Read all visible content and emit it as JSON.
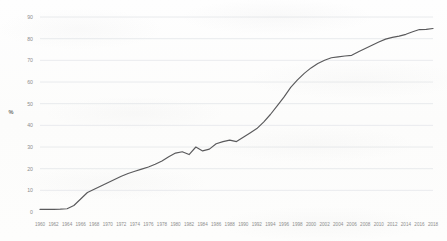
{
  "chart_data": {
    "type": "line",
    "title": "",
    "xlabel": "",
    "ylabel": "%",
    "ylim": [
      0,
      90
    ],
    "ytick_values": [
      0,
      10,
      20,
      30,
      40,
      50,
      60,
      70,
      80,
      90
    ],
    "ytick_labels": [
      "0",
      "10",
      "20",
      "30",
      "40",
      "50",
      "60",
      "70",
      "80",
      "90"
    ],
    "grid": true,
    "legend": "none",
    "xlim": [
      1960,
      2018
    ],
    "xtick_labels": [
      "1960",
      "1962",
      "1964",
      "1966",
      "1968",
      "1970",
      "1972",
      "1974",
      "1976",
      "1978",
      "1980",
      "1982",
      "1984",
      "1986",
      "1988",
      "1990",
      "1992",
      "1994",
      "1996",
      "1998",
      "2000",
      "2002",
      "2004",
      "2006",
      "2008",
      "2010",
      "2012",
      "2014",
      "2016",
      "2018"
    ],
    "line_color": "#5a5a5c",
    "series": [
      {
        "name": "%",
        "x": [
          1960,
          1961,
          1962,
          1963,
          1964,
          1965,
          1966,
          1967,
          1968,
          1969,
          1970,
          1971,
          1972,
          1973,
          1974,
          1975,
          1976,
          1977,
          1978,
          1979,
          1980,
          1981,
          1982,
          1983,
          1984,
          1985,
          1986,
          1987,
          1988,
          1989,
          1990,
          1991,
          1992,
          1993,
          1994,
          1995,
          1996,
          1997,
          1998,
          1999,
          2000,
          2001,
          2002,
          2003,
          2004,
          2005,
          2006,
          2007,
          2008,
          2009,
          2010,
          2011,
          2012,
          2013,
          2014,
          2015,
          2016,
          2017,
          2018
        ],
        "values": [
          1.2,
          1.2,
          1.2,
          1.3,
          1.5,
          3.0,
          6.0,
          9.0,
          10.5,
          12.0,
          13.5,
          15.0,
          16.5,
          17.8,
          18.8,
          19.8,
          20.8,
          22.0,
          23.5,
          25.5,
          27.2,
          27.8,
          26.5,
          30.0,
          28.2,
          29.0,
          31.5,
          32.5,
          33.2,
          32.5,
          34.5,
          36.5,
          38.5,
          41.5,
          45.0,
          49.0,
          53.0,
          57.5,
          61.0,
          64.0,
          66.5,
          68.5,
          70.0,
          71.2,
          71.6,
          72.0,
          72.3,
          74.0,
          75.5,
          77.0,
          78.5,
          79.8,
          80.6,
          81.2,
          82.0,
          83.2,
          84.2,
          84.3,
          84.7
        ]
      }
    ]
  }
}
